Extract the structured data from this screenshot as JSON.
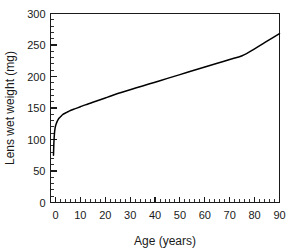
{
  "figure": {
    "background_color": "#ffffff",
    "line_color": "#000000",
    "axis_color": "#1a1a1a"
  },
  "chart_data": {
    "type": "line",
    "title": "",
    "subtitle": "",
    "xlabel": "Age (years)",
    "ylabel": "Lens wet weight (mg)",
    "xlim": [
      -2,
      90
    ],
    "ylim": [
      0,
      300
    ],
    "grid": false,
    "legend": null,
    "x_major_ticks": [
      0,
      10,
      20,
      30,
      40,
      50,
      60,
      70,
      80,
      90
    ],
    "x_tick_labels": [
      "0",
      "10",
      "20",
      "30",
      "40",
      "50",
      "60",
      "70",
      "80",
      "90"
    ],
    "x_minor_step": 2,
    "y_major_ticks": [
      0,
      50,
      100,
      150,
      200,
      250,
      300
    ],
    "y_tick_labels": [
      "0",
      "50",
      "100",
      "150",
      "200",
      "250",
      "300"
    ],
    "y_minor_step": 10,
    "series": [
      {
        "name": "Lens wet weight",
        "color": "#000000",
        "x": [
          -0.8,
          -0.7,
          -0.6,
          -0.4,
          -0.2,
          0,
          0.3,
          0.6,
          1,
          1.5,
          2,
          2.5,
          3,
          4,
          5,
          6,
          8,
          10,
          12,
          15,
          20,
          25,
          30,
          35,
          40,
          45,
          50,
          55,
          60,
          65,
          70,
          75,
          80,
          85,
          90
        ],
        "y": [
          75,
          88,
          98,
          110,
          117,
          121,
          125,
          128,
          131,
          134,
          136,
          138,
          140,
          142,
          144,
          146,
          149,
          152,
          155,
          159,
          166,
          173,
          179,
          185,
          191,
          197,
          203,
          209,
          215,
          221,
          227,
          233,
          244,
          256,
          268
        ]
      }
    ]
  }
}
